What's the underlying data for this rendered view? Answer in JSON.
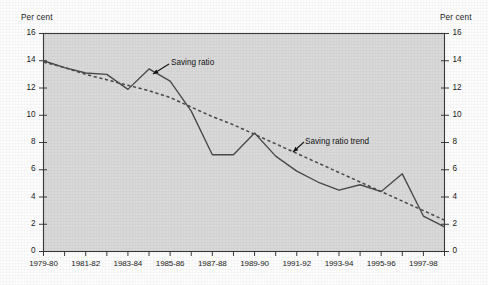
{
  "figure": {
    "background_color": "#fdfdfd",
    "plot_background_color": "#d9d9d9",
    "axis_color": "#3a3a3a",
    "series_color": "#4a4a4a",
    "trend_color": "#4a4a4a"
  },
  "axes": {
    "left_unit_label": "Per cent",
    "right_unit_label": "Per cent",
    "y_tick_labels": [
      "16",
      "14",
      "12",
      "10",
      "8",
      "6",
      "4",
      "2",
      "0"
    ],
    "x_tick_labels": [
      "1979-80",
      "1981-82",
      "1983-84",
      "1985-86",
      "1987-88",
      "1989-90",
      "1991-92",
      "1993-94",
      "1995-96",
      "1997-98"
    ]
  },
  "annotations": {
    "saving_ratio_label": "Saving ratio",
    "saving_ratio_trend_label": "Saving ratio trend"
  },
  "chart_data": {
    "type": "line",
    "title": "",
    "subtitle": "",
    "xlabel": "",
    "ylabel": "Per cent",
    "ylim": [
      0,
      16
    ],
    "y_ticks": [
      0,
      2,
      4,
      6,
      8,
      10,
      12,
      14,
      16
    ],
    "grid": false,
    "legend": "inline-annotations",
    "categories": [
      "1979-80",
      "1980-81",
      "1981-82",
      "1982-83",
      "1983-84",
      "1984-85",
      "1985-86",
      "1986-87",
      "1987-88",
      "1988-89",
      "1989-90",
      "1990-91",
      "1991-92",
      "1992-93",
      "1993-94",
      "1994-95",
      "1995-96",
      "1996-97",
      "1997-98",
      "1998-99"
    ],
    "series": [
      {
        "name": "Saving ratio",
        "style": "solid",
        "values": [
          14.0,
          13.5,
          13.1,
          13.0,
          11.9,
          13.4,
          12.5,
          10.3,
          7.1,
          7.1,
          8.7,
          7.0,
          5.9,
          5.1,
          4.5,
          4.9,
          4.4,
          5.7,
          2.6,
          1.8
        ]
      },
      {
        "name": "Saving ratio trend",
        "style": "dashed",
        "values": [
          13.9,
          13.5,
          13.0,
          12.6,
          12.2,
          11.8,
          11.3,
          10.6,
          9.9,
          9.3,
          8.6,
          7.9,
          7.2,
          6.5,
          5.8,
          5.1,
          4.4,
          3.7,
          3.0,
          2.3
        ]
      }
    ]
  }
}
